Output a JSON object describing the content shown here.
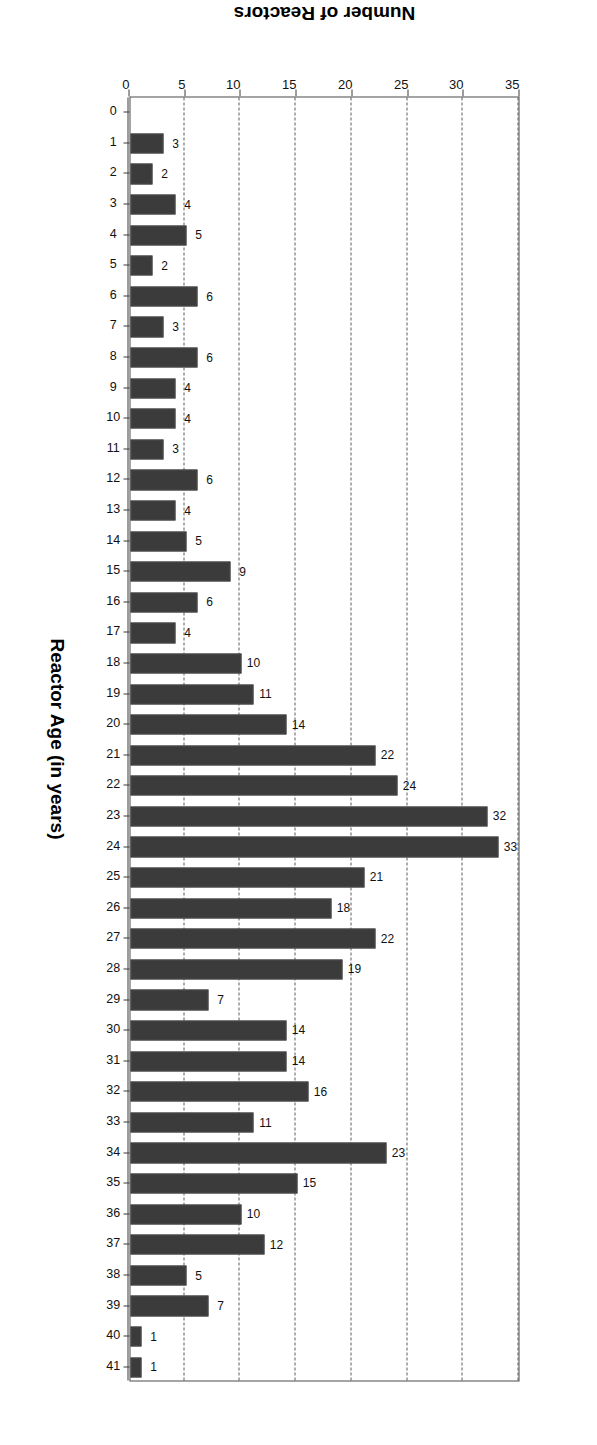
{
  "chart_data": {
    "type": "bar",
    "title": "",
    "xlabel": "Reactor Age (in years)",
    "ylabel": "Number of Reactors",
    "xlim": [
      0,
      41.5
    ],
    "ylim": [
      0,
      35
    ],
    "grid": true,
    "legend": null,
    "ytick_labels": [
      "0",
      "5",
      "10",
      "15",
      "20",
      "25",
      "30",
      "35"
    ],
    "ytick_values": [
      0,
      5,
      10,
      15,
      20,
      25,
      30,
      35
    ],
    "xtick_labels": [
      "0",
      "1",
      "2",
      "3",
      "4",
      "5",
      "6",
      "7",
      "8",
      "9",
      "10",
      "11",
      "12",
      "13",
      "14",
      "15",
      "16",
      "17",
      "18",
      "19",
      "20",
      "21",
      "22",
      "23",
      "24",
      "25",
      "26",
      "27",
      "28",
      "29",
      "30",
      "31",
      "32",
      "33",
      "34",
      "35",
      "36",
      "37",
      "38",
      "39",
      "40",
      "41"
    ],
    "categories": [
      1,
      2,
      3,
      4,
      5,
      6,
      7,
      8,
      9,
      10,
      11,
      12,
      13,
      14,
      15,
      16,
      17,
      18,
      19,
      20,
      21,
      22,
      23,
      24,
      25,
      26,
      27,
      28,
      29,
      30,
      31,
      32,
      33,
      34,
      35,
      36,
      37,
      38,
      39,
      40,
      41
    ],
    "values": [
      3,
      2,
      4,
      5,
      2,
      6,
      3,
      6,
      4,
      4,
      3,
      6,
      4,
      5,
      9,
      6,
      4,
      10,
      11,
      14,
      22,
      24,
      32,
      33,
      21,
      18,
      22,
      19,
      7,
      14,
      14,
      16,
      11,
      23,
      15,
      10,
      12,
      5,
      7,
      1,
      1
    ],
    "data_labels": [
      "3",
      "2",
      "4",
      "5",
      "2",
      "6",
      "3",
      "6",
      "4",
      "4",
      "3",
      "6",
      "4",
      "5",
      "9",
      "6",
      "4",
      "10",
      "11",
      "14",
      "22",
      "24",
      "32",
      "33",
      "21",
      "18",
      "22",
      "19",
      "7",
      "14",
      "14",
      "16",
      "11",
      "23",
      "15",
      "10",
      "12",
      "5",
      "7",
      "1",
      "1"
    ],
    "bar_color": "#8c8c8c",
    "bar_edge_color": "#2b2b2b",
    "bar_fill_pattern": "checkerboard-dither",
    "axis_color": "#3a3a3a",
    "gridline_style": "dashed"
  }
}
